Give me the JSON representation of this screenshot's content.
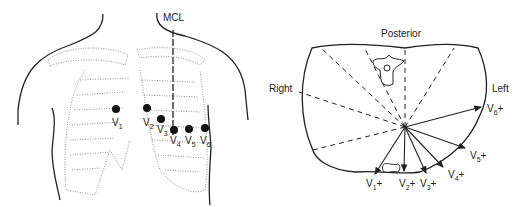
{
  "left_panel": {
    "mcl_label": "MCL",
    "electrodes": [
      {
        "name": "V",
        "sub": "1"
      },
      {
        "name": "V",
        "sub": "2"
      },
      {
        "name": "V",
        "sub": "3"
      },
      {
        "name": "V",
        "sub": "4"
      },
      {
        "name": "V",
        "sub": "5"
      },
      {
        "name": "V",
        "sub": "6"
      }
    ]
  },
  "right_panel": {
    "posterior_label": "Posterior",
    "right_label": "Right",
    "left_label": "Left",
    "leads": [
      {
        "name": "V",
        "sub": "1",
        "suffix": "+"
      },
      {
        "name": "V",
        "sub": "2",
        "suffix": "+"
      },
      {
        "name": "V",
        "sub": "3",
        "suffix": "+"
      },
      {
        "name": "V",
        "sub": "4",
        "suffix": "+"
      },
      {
        "name": "V",
        "sub": "5",
        "suffix": "+"
      },
      {
        "name": "V",
        "sub": "6",
        "suffix": "+"
      }
    ]
  }
}
